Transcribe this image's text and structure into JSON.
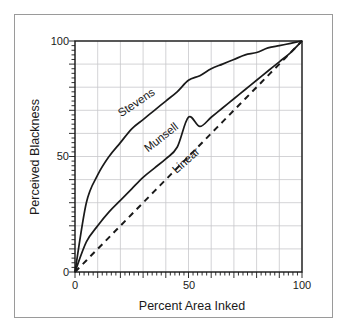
{
  "figure": {
    "background_color": "#ffffff",
    "frame_color": "#9a9a9a",
    "axis_color": "#1a1a1a",
    "grid_color": "#c8c8cc",
    "curve_color": "#1a1a1a"
  },
  "chart_data": {
    "type": "line",
    "title": "",
    "subtitle": "",
    "xlabel": "Percent Area Inked",
    "ylabel": "Perceived Blackness",
    "xlim": [
      0,
      100
    ],
    "ylim": [
      0,
      100
    ],
    "xticks": [
      0,
      50,
      100
    ],
    "yticks": [
      0,
      50,
      100
    ],
    "xtick_labels": [
      "0",
      "50",
      "100"
    ],
    "ytick_labels": [
      "0",
      "50",
      "100"
    ],
    "grid": true,
    "grid_step": 10,
    "minor_ticks": true,
    "legend": "inline-curve-labels",
    "legend_position": "along-curves",
    "x": [
      0,
      5,
      10,
      15,
      20,
      25,
      30,
      35,
      40,
      45,
      50,
      55,
      60,
      65,
      70,
      75,
      80,
      85,
      90,
      95,
      100
    ],
    "series": [
      {
        "name": "Stevens",
        "label": "Stevens",
        "style": "solid",
        "label_x": 28,
        "label_y": 72,
        "label_angle": -34,
        "values": [
          0,
          30,
          42,
          50,
          56,
          62,
          66,
          70,
          74,
          78,
          83,
          85,
          88,
          90,
          92,
          94,
          95,
          97,
          98,
          99,
          100
        ]
      },
      {
        "name": "Munsell",
        "label": "Munsell",
        "style": "solid",
        "label_x": 39,
        "label_y": 57,
        "label_angle": -38,
        "values": [
          0,
          13,
          20,
          26,
          31,
          36,
          41,
          45,
          49,
          54,
          67,
          63,
          67,
          71,
          75,
          79,
          83,
          87,
          91,
          95,
          100
        ]
      },
      {
        "name": "Linear",
        "label": "Linear",
        "style": "dashed",
        "label_x": 50,
        "label_y": 47,
        "label_angle": -42,
        "values": [
          0,
          5,
          10,
          15,
          20,
          25,
          30,
          35,
          40,
          45,
          50,
          55,
          60,
          65,
          70,
          75,
          80,
          85,
          90,
          95,
          100
        ]
      }
    ]
  }
}
